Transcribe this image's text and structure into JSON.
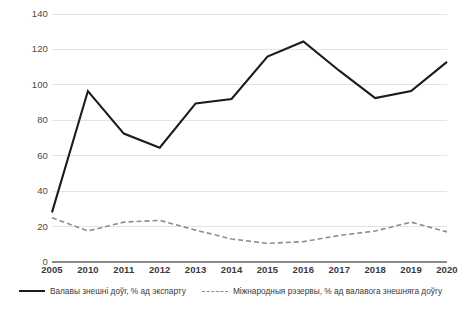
{
  "chart_data": {
    "type": "line",
    "title": "",
    "xlabel": "",
    "ylabel": "",
    "ylim": [
      0,
      140
    ],
    "ytick_step": 20,
    "grid": true,
    "legend_position": "bottom",
    "categories": [
      "2005",
      "2010",
      "2011",
      "2012",
      "2013",
      "2014",
      "2015",
      "2016",
      "2017",
      "2018",
      "2019",
      "2020"
    ],
    "yticks": [
      "0",
      "20",
      "40",
      "60",
      "80",
      "100",
      "120",
      "140"
    ],
    "series": [
      {
        "name": "Валавы знешні доўг, % ад экспарту",
        "style": "solid",
        "color": "#1b1b1b",
        "values": [
          28,
          96.5,
          72.5,
          64.5,
          89.5,
          92,
          116,
          124.5,
          108,
          92.5,
          96.5,
          113
        ]
      },
      {
        "name": "Міжнародныя рэзервы, % ад валавога знешняга доўгу",
        "style": "dashed",
        "color": "#8d8d8d",
        "values": [
          25,
          17.5,
          22.5,
          23.5,
          18,
          13,
          10.5,
          11.5,
          15,
          17.5,
          22.5,
          17
        ]
      }
    ]
  },
  "legend": {
    "entries": [
      {
        "label": "Валавы знешні доўг, % ад экспарту"
      },
      {
        "label": "Міжнародныя рэзервы, % ад валавога знешняга доўгу"
      }
    ]
  },
  "colors": {
    "series_primary": "#1b1b1b",
    "series_secondary": "#8d8d8d",
    "gridline": "#e3e3e3",
    "axis": "#8a8a8a",
    "text": "#3a3a3a",
    "background": "#ffffff"
  }
}
